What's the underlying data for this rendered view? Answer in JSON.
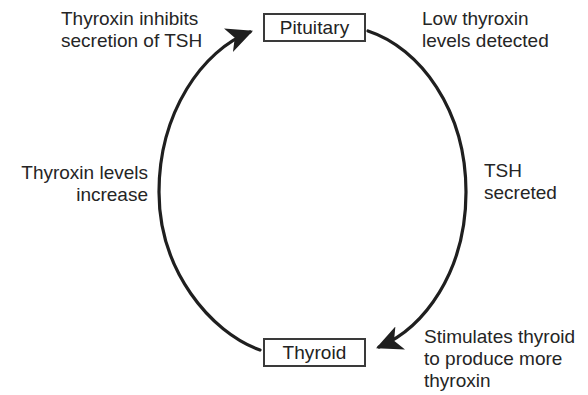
{
  "diagram": {
    "type": "cycle-flow",
    "stroke_color": "#1f1f1f",
    "text_color": "#252525",
    "background_color": "#ffffff",
    "nodes": [
      {
        "id": "pituitary",
        "label": "Pituitary"
      },
      {
        "id": "thyroid",
        "label": "Thyroid"
      }
    ],
    "edges": [
      {
        "id": "low-thyroxin-detected",
        "from": "pituitary",
        "to": "thyroid",
        "side": "right-upper",
        "label": "Low thyroxin\nlevels detected"
      },
      {
        "id": "tsh-secreted",
        "from": "pituitary",
        "to": "thyroid",
        "side": "right-lower",
        "label": "TSH\nsecreted"
      },
      {
        "id": "stimulates-thyroid",
        "from": "pituitary",
        "to": "thyroid",
        "side": "bottom-right",
        "label": "Stimulates thyroid\nto produce more\nthyroxin"
      },
      {
        "id": "thyroxin-levels-increase",
        "from": "thyroid",
        "to": "pituitary",
        "side": "left-lower",
        "label": "Thyroxin levels\nincrease"
      },
      {
        "id": "thyroxin-inhibits-tsh",
        "from": "thyroid",
        "to": "pituitary",
        "side": "left-upper",
        "label": "Thyroxin inhibits\nsecretion of TSH"
      }
    ],
    "arrows": [
      {
        "id": "arrow-into-pituitary",
        "points_to": "pituitary",
        "direction": "up-right"
      },
      {
        "id": "arrow-into-thyroid",
        "points_to": "thyroid",
        "direction": "down-left"
      }
    ]
  }
}
